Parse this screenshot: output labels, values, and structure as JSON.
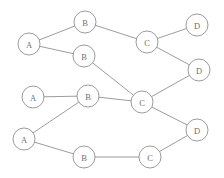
{
  "diagram": {
    "background_color": "#ffffff",
    "edge_color": "#8a8a8a",
    "node_fill": "#ffffff",
    "node_stroke": "#8a8a8a",
    "label_color": "#6f6f6f",
    "node_radius": 11,
    "nodes": [
      {
        "id": "b-top",
        "label": "B",
        "x": 85,
        "y": 22,
        "layer": "B"
      },
      {
        "id": "d-top",
        "label": "D",
        "x": 197,
        "y": 25,
        "layer": "D"
      },
      {
        "id": "c-top",
        "label": "C",
        "x": 147,
        "y": 42,
        "layer": "C"
      },
      {
        "id": "a-top",
        "label": "A",
        "x": 29,
        "y": 44,
        "layer": "A"
      },
      {
        "id": "b-upper-mid",
        "label": "B",
        "x": 84,
        "y": 56,
        "layer": "B"
      },
      {
        "id": "d-upper-mid",
        "label": "D",
        "x": 199,
        "y": 70,
        "layer": "D"
      },
      {
        "id": "a-mid",
        "label": "A",
        "x": 33,
        "y": 97,
        "layer": "A"
      },
      {
        "id": "b-mid",
        "label": "B",
        "x": 88,
        "y": 96,
        "layer": "B"
      },
      {
        "id": "c-mid",
        "label": "C",
        "x": 142,
        "y": 102,
        "layer": "C"
      },
      {
        "id": "d-bottom",
        "label": "D",
        "x": 197,
        "y": 130,
        "layer": "D"
      },
      {
        "id": "a-bottom",
        "label": "A",
        "x": 24,
        "y": 139,
        "layer": "A"
      },
      {
        "id": "b-bottom",
        "label": "B",
        "x": 84,
        "y": 157,
        "layer": "B"
      },
      {
        "id": "c-bottom",
        "label": "C",
        "x": 150,
        "y": 157,
        "layer": "C"
      }
    ],
    "edges": [
      {
        "id": "e1",
        "from": "a-top",
        "to": "b-top"
      },
      {
        "id": "e2",
        "from": "a-top",
        "to": "b-upper-mid"
      },
      {
        "id": "e3",
        "from": "b-top",
        "to": "c-top"
      },
      {
        "id": "e4",
        "from": "c-top",
        "to": "d-top"
      },
      {
        "id": "e5",
        "from": "c-top",
        "to": "d-upper-mid"
      },
      {
        "id": "e6",
        "from": "b-upper-mid",
        "to": "c-mid"
      },
      {
        "id": "e7",
        "from": "d-upper-mid",
        "to": "c-mid"
      },
      {
        "id": "e8",
        "from": "a-mid",
        "to": "b-mid"
      },
      {
        "id": "e9",
        "from": "b-mid",
        "to": "c-mid"
      },
      {
        "id": "e10",
        "from": "a-bottom",
        "to": "b-mid"
      },
      {
        "id": "e11",
        "from": "a-bottom",
        "to": "b-bottom"
      },
      {
        "id": "e12",
        "from": "b-bottom",
        "to": "c-bottom"
      },
      {
        "id": "e13",
        "from": "c-bottom",
        "to": "d-bottom"
      },
      {
        "id": "e14",
        "from": "c-mid",
        "to": "d-bottom"
      }
    ]
  }
}
